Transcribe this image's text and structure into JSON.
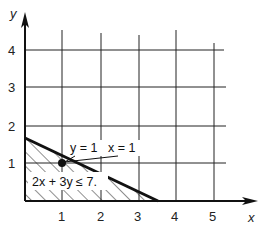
{
  "diagram": {
    "x_axis_label": "x",
    "y_axis_label": "y",
    "x_ticks": [
      "1",
      "2",
      "3",
      "4",
      "5"
    ],
    "y_ticks": [
      "1",
      "2",
      "3",
      "4"
    ],
    "point_label_y": "y = 1",
    "point_label_x": "x = 1",
    "inequality": "2x + 3y ≤ 7.",
    "point": {
      "x": 1,
      "y": 1
    },
    "boundary_line": "2x + 3y = 7",
    "colors": {
      "ink": "#111111",
      "background": "#ffffff"
    }
  }
}
